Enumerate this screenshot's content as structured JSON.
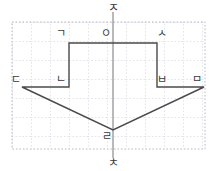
{
  "figure": {
    "title": "",
    "shape_name": "downward-arrow-polygon",
    "grid": {
      "visible": true,
      "style": "dotted",
      "color": "#c9c9d6",
      "border_color": "#b9b9c8",
      "cell_size_px": 19,
      "bounds_px": {
        "x": 12,
        "y": 22,
        "width": 193,
        "height": 127
      }
    },
    "axis": {
      "vertical_line_color": "#8a8a8a",
      "top_label": "ㅈ",
      "bottom_label": "ㅊ",
      "top_label_name": "axis-label-top-jieut",
      "bottom_label_name": "axis-label-bottom-chieut"
    },
    "outline": {
      "stroke": "#4a4a4a",
      "stroke_width": 1.4,
      "fill": "none"
    },
    "vertices": [
      {
        "id": "g",
        "label": "ㄱ",
        "x": 69,
        "y": 43,
        "label_x": 56,
        "label_y": 28
      },
      {
        "id": "o",
        "label": "ㅇ",
        "x": 113,
        "y": 43,
        "label_x": 101,
        "label_y": 28
      },
      {
        "id": "s",
        "label": "ㅅ",
        "x": 157,
        "y": 43,
        "label_x": 157,
        "label_y": 28
      },
      {
        "id": "d",
        "label": "ㄷ",
        "x": 22,
        "y": 87,
        "label_x": 11,
        "label_y": 74
      },
      {
        "id": "n",
        "label": "ㄴ",
        "x": 69,
        "y": 87,
        "label_x": 56,
        "label_y": 74
      },
      {
        "id": "b",
        "label": "ㅂ",
        "x": 157,
        "y": 87,
        "label_x": 157,
        "label_y": 74
      },
      {
        "id": "m",
        "label": "ㅁ",
        "x": 204,
        "y": 87,
        "label_x": 192,
        "label_y": 74
      },
      {
        "id": "r",
        "label": "ㄹ",
        "x": 113,
        "y": 130,
        "label_x": 102,
        "label_y": 131
      }
    ],
    "outline_path": "M 69 43 L 157 43 L 157 87 L 204 87 L 113 130 L 22 87 L 69 87 Z",
    "axis_top_point": {
      "x": 113,
      "y": 12
    },
    "axis_bottom_point": {
      "x": 113,
      "y": 158
    }
  }
}
